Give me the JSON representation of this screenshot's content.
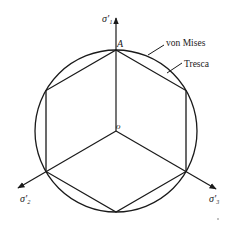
{
  "diagram": {
    "type": "yield-surface-pi-plane",
    "center": {
      "x": 116,
      "y": 131
    },
    "radius": 81,
    "colors": {
      "stroke": "#1a1a1a",
      "background": "#ffffff"
    },
    "labels": {
      "axis_1": "σ'₁",
      "axis_2": "σ'₂",
      "axis_3": "σ'₃",
      "point_A": "A",
      "origin": "o",
      "von_mises": "von Mises",
      "tresca": "Tresca"
    },
    "curves": [
      {
        "name": "von Mises",
        "shape": "circle"
      },
      {
        "name": "Tresca",
        "shape": "hexagon"
      }
    ]
  }
}
